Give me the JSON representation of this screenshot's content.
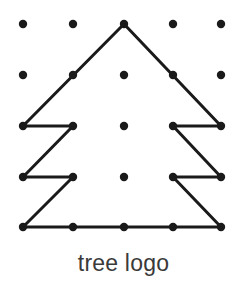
{
  "figure": {
    "title": "tree logo",
    "caption": "tree logo",
    "background_color": "#ffffff",
    "ink_color": "#1a1a1a",
    "caption_color": "#3a3a3a"
  },
  "chart_data": {
    "type": "scatter",
    "title": "tree logo",
    "subtitle": "",
    "xlabel": "",
    "ylabel": "",
    "grid": false,
    "legend": "none",
    "grid_size": {
      "columns": 5,
      "rows": 5
    },
    "grid_spacing_px": 50,
    "xlim": [
      0,
      4
    ],
    "ylim": [
      0,
      4
    ],
    "x_tick_labels": [
      "0",
      "1",
      "2",
      "3",
      "4"
    ],
    "y_tick_labels": [
      "0",
      "1",
      "2",
      "3",
      "4"
    ],
    "dot_radius_px": 4.2,
    "line_width_px": 3,
    "points": [
      {
        "id": "r0c0",
        "col": 0,
        "row": 0,
        "x": 23,
        "y": 24
      },
      {
        "id": "r0c1",
        "col": 1,
        "row": 0,
        "x": 73,
        "y": 24
      },
      {
        "id": "r0c2",
        "col": 2,
        "row": 0,
        "x": 124,
        "y": 24
      },
      {
        "id": "r0c3",
        "col": 3,
        "row": 0,
        "x": 173,
        "y": 24
      },
      {
        "id": "r0c4",
        "col": 4,
        "row": 0,
        "x": 221,
        "y": 24
      },
      {
        "id": "r1c0",
        "col": 0,
        "row": 1,
        "x": 23,
        "y": 75
      },
      {
        "id": "r1c1",
        "col": 1,
        "row": 1,
        "x": 73,
        "y": 75
      },
      {
        "id": "r1c2",
        "col": 2,
        "row": 1,
        "x": 124,
        "y": 75
      },
      {
        "id": "r1c3",
        "col": 3,
        "row": 1,
        "x": 173,
        "y": 75
      },
      {
        "id": "r1c4",
        "col": 4,
        "row": 1,
        "x": 221,
        "y": 75
      },
      {
        "id": "r2c0",
        "col": 0,
        "row": 2,
        "x": 23,
        "y": 126
      },
      {
        "id": "r2c1",
        "col": 1,
        "row": 2,
        "x": 73,
        "y": 126
      },
      {
        "id": "r2c2",
        "col": 2,
        "row": 2,
        "x": 124,
        "y": 126
      },
      {
        "id": "r2c3",
        "col": 3,
        "row": 2,
        "x": 173,
        "y": 126
      },
      {
        "id": "r2c4",
        "col": 4,
        "row": 2,
        "x": 221,
        "y": 126
      },
      {
        "id": "r3c0",
        "col": 0,
        "row": 3,
        "x": 23,
        "y": 177
      },
      {
        "id": "r3c1",
        "col": 1,
        "row": 3,
        "x": 73,
        "y": 177
      },
      {
        "id": "r3c2",
        "col": 2,
        "row": 3,
        "x": 124,
        "y": 177
      },
      {
        "id": "r3c3",
        "col": 3,
        "row": 3,
        "x": 173,
        "y": 177
      },
      {
        "id": "r3c4",
        "col": 4,
        "row": 3,
        "x": 221,
        "y": 177
      },
      {
        "id": "r4c0",
        "col": 0,
        "row": 4,
        "x": 23,
        "y": 227
      },
      {
        "id": "r4c1",
        "col": 1,
        "row": 4,
        "x": 73,
        "y": 227
      },
      {
        "id": "r4c2",
        "col": 2,
        "row": 4,
        "x": 124,
        "y": 227
      },
      {
        "id": "r4c3",
        "col": 3,
        "row": 4,
        "x": 173,
        "y": 227
      },
      {
        "id": "r4c4",
        "col": 4,
        "row": 4,
        "x": 221,
        "y": 227
      }
    ],
    "segments": [
      {
        "name": "apex-to-left-upper",
        "from": "r0c2",
        "to": "r2c0"
      },
      {
        "name": "left-tier1-horizontal",
        "from": "r2c0",
        "to": "r2c1"
      },
      {
        "name": "left-tier1-diagonal",
        "from": "r2c1",
        "to": "r3c0"
      },
      {
        "name": "left-tier2-horizontal",
        "from": "r3c0",
        "to": "r3c1"
      },
      {
        "name": "left-tier2-diagonal",
        "from": "r3c1",
        "to": "r4c0"
      },
      {
        "name": "trunk-base-horizontal",
        "from": "r4c0",
        "to": "r4c4"
      },
      {
        "name": "right-tier2-diagonal",
        "from": "r4c4",
        "to": "r3c3"
      },
      {
        "name": "right-tier2-horizontal",
        "from": "r3c3",
        "to": "r3c4"
      },
      {
        "name": "right-tier1-diagonal",
        "from": "r3c4",
        "to": "r2c3"
      },
      {
        "name": "right-tier1-horizontal",
        "from": "r2c3",
        "to": "r2c4"
      },
      {
        "name": "apex-to-right-upper",
        "from": "r2c4",
        "to": "r0c2"
      }
    ]
  }
}
